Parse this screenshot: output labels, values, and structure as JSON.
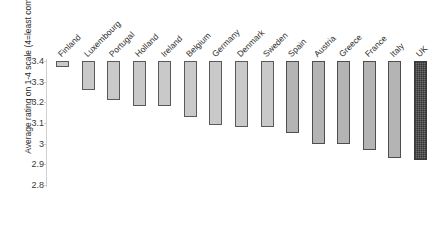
{
  "chart_data": {
    "type": "bar",
    "title": "",
    "xlabel": "",
    "ylabel": "Average rating on 1-4 scale (4=least complex)",
    "ylim": [
      2.8,
      3.4
    ],
    "yticks": [
      "3.4",
      "3.3",
      "3.2",
      "3.1",
      "3",
      "2.9",
      "2.8"
    ],
    "ytick_values": [
      3.4,
      3.3,
      3.2,
      3.1,
      3.0,
      2.9,
      2.8
    ],
    "grid": false,
    "legend": "none",
    "bar_baseline_top": 3.4,
    "note": "Floating bars hang down from 3.4; bar bottom equals the country value.",
    "categories": [
      "Finland",
      "Luxembourg",
      "Portugal",
      "Holland",
      "Ireland",
      "Belgium",
      "Germany",
      "Denmark",
      "Sweden",
      "Spain",
      "Austria",
      "Greece",
      "France",
      "Italy",
      "UK"
    ],
    "values": [
      3.37,
      3.26,
      3.21,
      3.18,
      3.18,
      3.13,
      3.09,
      3.08,
      3.08,
      3.05,
      3.0,
      3.0,
      2.97,
      2.93,
      2.92
    ],
    "styles": [
      "light",
      "light",
      "light",
      "light",
      "light",
      "light",
      "light",
      "light",
      "light",
      "mid",
      "mid",
      "mid",
      "mid",
      "mid",
      "dark"
    ]
  }
}
